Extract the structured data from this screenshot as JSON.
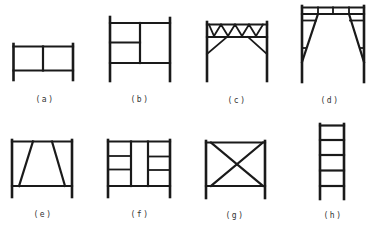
{
  "figure": {
    "stroke_color": "#1a1a1a",
    "label_color": "#333333",
    "frames": [
      {
        "id": "a",
        "label": "(a)",
        "kind": "two-bay walk-through low frame"
      },
      {
        "id": "b",
        "label": "(b)",
        "kind": "frame with half-height shelf bay"
      },
      {
        "id": "c",
        "label": "(c)",
        "kind": "truss-top frame with knee braces"
      },
      {
        "id": "d",
        "label": "(d)",
        "kind": "arch / walk-through frame with diagonal legs"
      },
      {
        "id": "e",
        "label": "(e)",
        "kind": "trapezoidal braced frame"
      },
      {
        "id": "f",
        "label": "(f)",
        "kind": "three-bay frame with side rungs"
      },
      {
        "id": "g",
        "label": "(g)",
        "kind": "cross-braced frame"
      },
      {
        "id": "h",
        "label": "(h)",
        "kind": "ladder frame"
      }
    ]
  }
}
